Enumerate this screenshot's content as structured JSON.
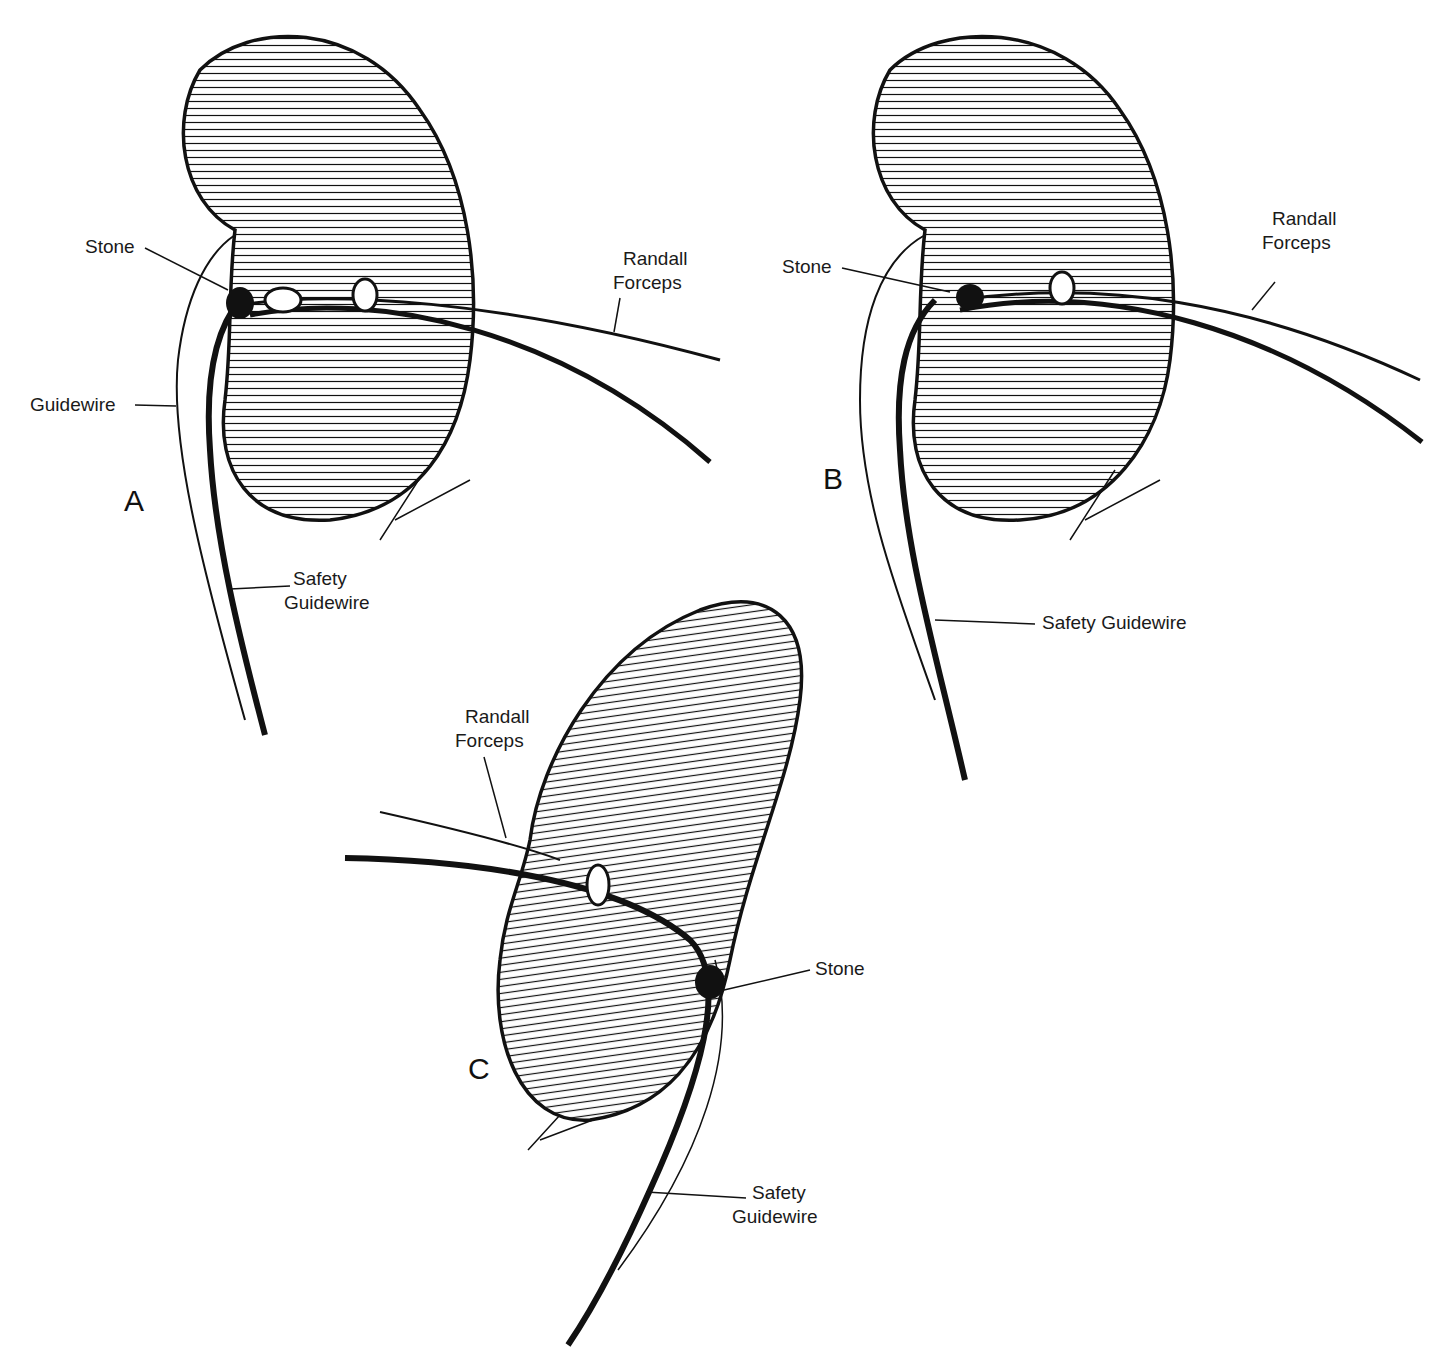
{
  "figure": {
    "panels": [
      {
        "id": "A",
        "letter": "A",
        "labels": {
          "stone": "Stone",
          "guidewire": "Guidewire",
          "forceps_1": "Randall",
          "forceps_2": "Forceps",
          "safety_1": "Safety",
          "safety_2": "Guidewire"
        },
        "signature": "Finch '85"
      },
      {
        "id": "B",
        "letter": "B",
        "labels": {
          "stone": "Stone",
          "forceps_1": "Randall",
          "forceps_2": "Forceps",
          "safety": "Safety Guidewire"
        },
        "signature": "Finch '85"
      },
      {
        "id": "C",
        "letter": "C",
        "labels": {
          "stone": "Stone",
          "forceps_1": "Randall",
          "forceps_2": "Forceps",
          "safety_1": "Safety",
          "safety_2": "Guidewire"
        },
        "signature": "Finch '85"
      }
    ]
  }
}
